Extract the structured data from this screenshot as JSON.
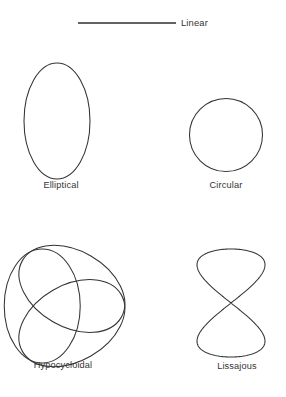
{
  "page": {
    "width": 286,
    "height": 397,
    "background_color": "#ffffff",
    "stroke_color": "#333333",
    "text_color": "#343434",
    "cropped_header_artifact": ""
  },
  "legend": {
    "label": "Linear",
    "line_x_start": 78,
    "line_x_end": 176,
    "line_y": 23,
    "line_color": "#2e2e2e"
  },
  "figures": [
    {
      "id": "elliptical",
      "caption": "Elliptical",
      "type": "ellipse",
      "center_x": 57,
      "center_y": 121,
      "radius_x": 33,
      "radius_y": 58,
      "caption_x": 61,
      "caption_y": 180
    },
    {
      "id": "circular",
      "caption": "Circular",
      "type": "circle",
      "center_x": 226,
      "center_y": 135,
      "radius": 36.5,
      "caption_x": 226,
      "caption_y": 180
    },
    {
      "id": "hypocycloidal",
      "caption": "Hypocycloidal",
      "type": "three-lobed-rosette",
      "center_x": 62,
      "center_y": 306,
      "lobe_count": 3,
      "lobe_radius_x": 57,
      "lobe_radius_y": 38,
      "lobe_rotations_deg": [
        90,
        210,
        330
      ],
      "caption_x": 63,
      "caption_y": 360
    },
    {
      "id": "lissajous",
      "caption": "Lissajous",
      "type": "figure-eight",
      "center_x": 231,
      "center_y": 303,
      "half_width": 34,
      "half_height": 54,
      "frequency_ratio": "1:2",
      "caption_x": 237,
      "caption_y": 361
    }
  ],
  "chart_data": {
    "type": "line",
    "title": "",
    "subtitle": "",
    "xlabel": "",
    "ylabel": "",
    "grid": false,
    "legend_position": "top",
    "annotations": [
      "Linear",
      "Elliptical",
      "Circular",
      "Hypocycloidal",
      "Lissajous"
    ],
    "series": [
      {
        "name": "Linear",
        "description": "Straight horizontal reference line segment",
        "parametric": "x = t, y = 0",
        "x": [
          78,
          176
        ],
        "y": [
          23,
          23
        ]
      },
      {
        "name": "Elliptical",
        "description": "Vertically elongated closed ellipse",
        "parametric": "x = 33*cos(t), y = 58*sin(t)",
        "center": [
          57,
          121
        ],
        "semi_axes": [
          33,
          58
        ]
      },
      {
        "name": "Circular",
        "description": "Closed circle",
        "parametric": "x = 36.5*cos(t), y = 36.5*sin(t)",
        "center": [
          226,
          135
        ],
        "semi_axes": [
          36.5,
          36.5
        ]
      },
      {
        "name": "Hypocycloidal",
        "description": "Three overlapping ellipses at 120 degree rotations forming a trefoil rosette",
        "parametric": "three ellipses 57 x 38 rotated 90, 210, 330 degrees",
        "center": [
          62,
          306
        ],
        "semi_axes": [
          57,
          38
        ]
      },
      {
        "name": "Lissajous",
        "description": "Figure-eight Lissajous curve with 1:2 frequency ratio",
        "parametric": "x = 34*sin(2t), y = 54*sin(t)",
        "center": [
          231,
          303
        ],
        "semi_axes": [
          34,
          54
        ]
      }
    ]
  }
}
